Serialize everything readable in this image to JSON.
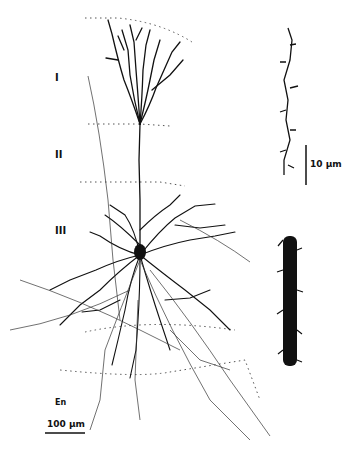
{
  "figure": {
    "layers": [
      {
        "label": "I"
      },
      {
        "label": "II"
      },
      {
        "label": "III"
      },
      {
        "label": "En"
      }
    ],
    "scale_bars": {
      "main": "100 µm",
      "inset": "10 µm"
    },
    "colors": {
      "ink": "#111111",
      "background": "#ffffff",
      "boundary": "#555555"
    }
  }
}
